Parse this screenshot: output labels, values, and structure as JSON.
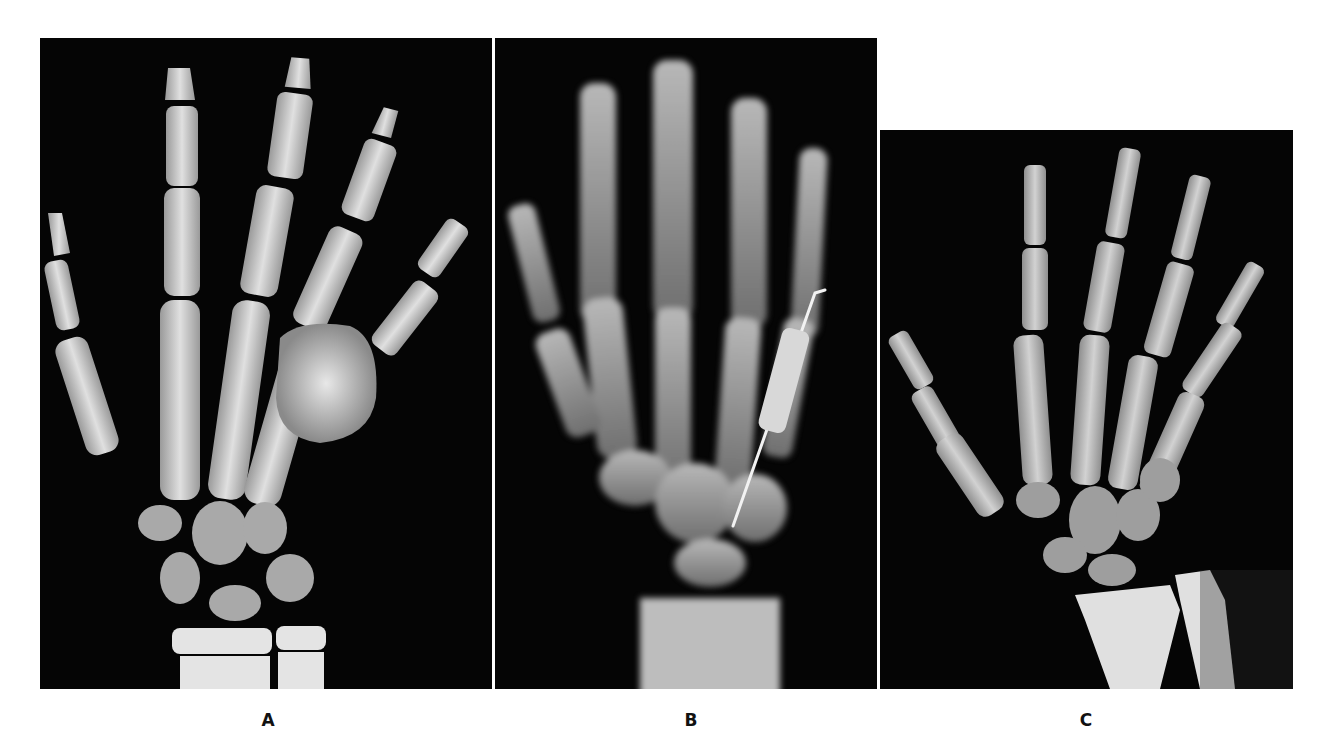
{
  "figure": {
    "type": "radiograph-panel-figure",
    "panels": [
      {
        "id": "A",
        "label": "A",
        "description": "Hand radiograph with expansile lesion of the fifth metacarpal region"
      },
      {
        "id": "B",
        "label": "B",
        "description": "Hand radiograph with bent surgical pin (Kirschner wire) through fifth metacarpal"
      },
      {
        "id": "C",
        "label": "C",
        "description": "Hand and wrist radiograph, normal appearance, including distal radius and ulna"
      }
    ]
  },
  "colors": {
    "background": "#ffffff",
    "panel_background": "#050505",
    "bone": "#d9d9d9",
    "label": "#111111"
  }
}
